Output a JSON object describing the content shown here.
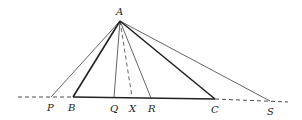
{
  "diagram": {
    "type": "geometry",
    "points": {
      "A": {
        "label": "A",
        "x": 120,
        "y": 21,
        "lx": 116,
        "ly": 15
      },
      "P": {
        "label": "P",
        "x": 51,
        "y": 97,
        "lx": 47,
        "ly": 111
      },
      "B": {
        "label": "B",
        "x": 73,
        "y": 97,
        "lx": 68,
        "ly": 111
      },
      "Q": {
        "label": "Q",
        "x": 114,
        "y": 97,
        "lx": 110,
        "ly": 112
      },
      "X": {
        "label": "X",
        "x": 132,
        "y": 97,
        "lx": 129,
        "ly": 112
      },
      "R": {
        "label": "R",
        "x": 151,
        "y": 98,
        "lx": 148,
        "ly": 112
      },
      "C": {
        "label": "C",
        "x": 215,
        "y": 99,
        "lx": 211,
        "ly": 113
      },
      "S": {
        "label": "S",
        "x": 270,
        "y": 101,
        "lx": 267,
        "ly": 115
      }
    },
    "colors": {
      "line": "#222222",
      "background": "#ffffff"
    }
  }
}
